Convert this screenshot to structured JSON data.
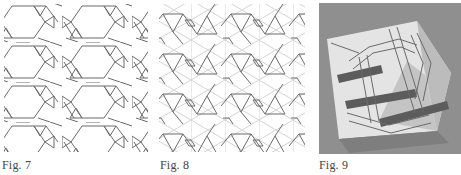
{
  "figures": [
    {
      "id": "fig7",
      "caption": "Fig. 7",
      "kind": "line-drawing",
      "description": "Interlaced hexagonal/triangular lattice pattern"
    },
    {
      "id": "fig8",
      "caption": "Fig. 8",
      "kind": "line-drawing",
      "description": "Interlaced pattern over triangular grid construction lines"
    },
    {
      "id": "fig9",
      "caption": "Fig. 9",
      "kind": "photograph",
      "description": "Folded paper octahedron printed with interlaced pattern"
    }
  ],
  "colors": {
    "line": "#6a6a6a",
    "grid": "#c8c8c8",
    "photo_bg": "#8f8f8f",
    "paper_light": "#e6e6e6",
    "paper_mid": "#bdbdbd",
    "band_dark": "#5a5a5a"
  }
}
